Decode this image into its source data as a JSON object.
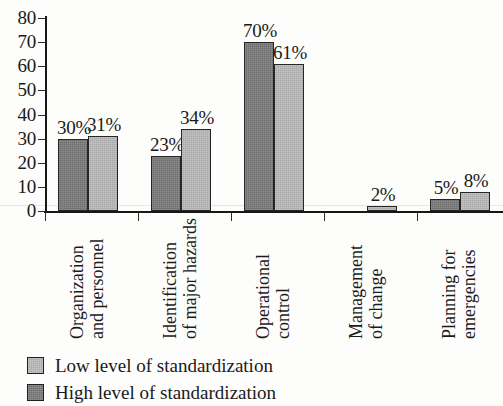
{
  "chart_data": {
    "type": "bar",
    "title": "",
    "xlabel": "",
    "ylabel": "",
    "ylim": [
      0,
      80
    ],
    "yticks": [
      0,
      10,
      20,
      30,
      40,
      50,
      60,
      70,
      80
    ],
    "grid": false,
    "legend_position": "bottom-left",
    "categories": [
      "Organization and personnel",
      "Identification of major hazards",
      "Operational control",
      "Management of change",
      "Planning for emergencies"
    ],
    "category_lines": [
      [
        "Organization",
        "and personnel"
      ],
      [
        "Identification",
        "of major hazards"
      ],
      [
        "Operational",
        "control"
      ],
      [
        "Management",
        "of change"
      ],
      [
        "Planning for",
        "emergencies"
      ]
    ],
    "series": [
      {
        "name": "High level of standardization",
        "color": "#6e6e6e",
        "values": [
          30,
          23,
          70,
          null,
          5
        ],
        "labels": [
          "30%",
          "23%",
          "70%",
          "",
          "5%"
        ]
      },
      {
        "name": "Low level of standardization",
        "color": "#a9a9a9",
        "values": [
          31,
          34,
          61,
          2,
          8
        ],
        "labels": [
          "31%",
          "34%",
          "61%",
          "2%",
          "8%"
        ]
      }
    ]
  },
  "legend": {
    "items": [
      {
        "label": "Low level of standardization",
        "swatch": "low"
      },
      {
        "label": "High level of standardization",
        "swatch": "high"
      }
    ]
  },
  "axis": {
    "y_tick_labels": [
      "80",
      "70",
      "60",
      "50",
      "40",
      "30",
      "20",
      "10",
      "0"
    ]
  }
}
